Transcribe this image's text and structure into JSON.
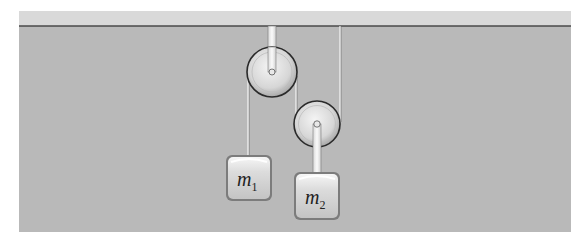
{
  "diagram": {
    "type": "pulley-system",
    "colors": {
      "background": "#ffffff",
      "panel": "#b9b9b9",
      "ceiling": "#d9d9d9",
      "ceiling_line": "#4a4a4a",
      "rope": "#efefef",
      "pulley_fill": "#dedede",
      "pulley_stroke": "#2a2a2a",
      "block_fill": "#d4d4d4",
      "block_edge": "#555555"
    },
    "ceiling": {
      "label": ""
    },
    "pulleys": [
      {
        "id": "fixed-pulley",
        "cx": 272,
        "cy": 72,
        "r": 25
      },
      {
        "id": "movable-pulley",
        "cx": 317,
        "cy": 124,
        "r": 23
      }
    ],
    "masses": [
      {
        "id": "m1",
        "name": "m",
        "subscript": "1",
        "x": 226,
        "y": 155,
        "w": 46,
        "h": 46
      },
      {
        "id": "m2",
        "name": "m",
        "subscript": "2",
        "x": 294,
        "y": 172,
        "w": 46,
        "h": 48
      }
    ]
  }
}
